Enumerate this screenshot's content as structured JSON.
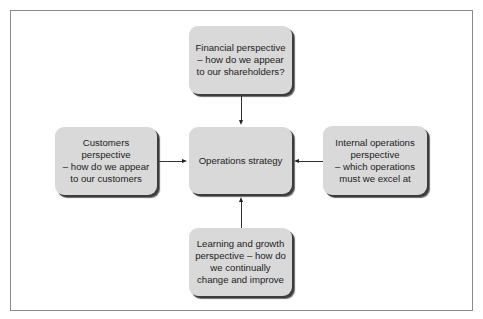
{
  "diagram": {
    "type": "hub-and-spoke",
    "center": {
      "id": "operations-strategy",
      "label": "Operations strategy"
    },
    "nodes": {
      "top": {
        "id": "financial",
        "label": "Financial perspective\n– how do we appear\nto our shareholders?"
      },
      "left": {
        "id": "customers",
        "label": "Customers\nperspective\n– how do we appear\nto our customers"
      },
      "right": {
        "id": "internal",
        "label": "Internal operations\nperspective\n– which operations\nmust we excel at"
      },
      "bottom": {
        "id": "learning",
        "label": "Learning and growth\nperspective – how do\nwe continually\nchange and improve"
      }
    },
    "edges": [
      {
        "from": "financial",
        "to": "operations-strategy"
      },
      {
        "from": "customers",
        "to": "operations-strategy"
      },
      {
        "from": "internal",
        "to": "operations-strategy"
      },
      {
        "from": "learning",
        "to": "operations-strategy"
      }
    ],
    "colors": {
      "box_fill": "#d9d9d9",
      "box_shadow": "#3c3c3c",
      "frame_border": "#8a8a8a",
      "text": "#222222",
      "arrow": "#222222"
    }
  }
}
